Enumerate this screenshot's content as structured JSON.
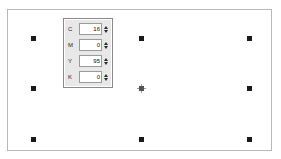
{
  "window": {
    "title": "Ellipse selection with CMYK color panel"
  },
  "canvas": {
    "name": "drawing-canvas",
    "shape": "ellipse",
    "shape_fill": "#cbcbcb",
    "background": "#c9c9c9",
    "page_background": "#ffffff"
  },
  "selection": {
    "label": "selected-object",
    "handle_color": "#1a1a1a",
    "handles": [
      {
        "name": "handle-top-left",
        "x": 0,
        "y": 0
      },
      {
        "name": "handle-top-center",
        "x": 108,
        "y": 0
      },
      {
        "name": "handle-top-right",
        "x": 216,
        "y": 0
      },
      {
        "name": "handle-middle-left",
        "x": 0,
        "y": 50
      },
      {
        "name": "handle-middle-right",
        "x": 216,
        "y": 50
      },
      {
        "name": "handle-bottom-left",
        "x": 0,
        "y": 101
      },
      {
        "name": "handle-bottom-center",
        "x": 108,
        "y": 101
      },
      {
        "name": "handle-bottom-right",
        "x": 216,
        "y": 101
      }
    ],
    "center_marker": {
      "name": "center-move-marker",
      "x": 108,
      "y": 50
    }
  },
  "cmyk_panel": {
    "title": "CMYK color values",
    "spin_up_icon": "spinner-up-arrow",
    "spin_down_icon": "spinner-down-arrow",
    "rows": [
      {
        "label": "C",
        "value": "16"
      },
      {
        "label": "M",
        "value": "0"
      },
      {
        "label": "Y",
        "value": "95"
      },
      {
        "label": "K",
        "value": "0"
      }
    ]
  }
}
